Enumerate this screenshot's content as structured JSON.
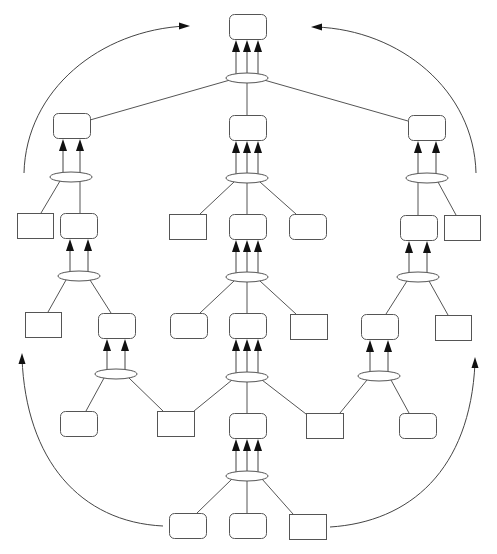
{
  "diagram": {
    "title": "",
    "caption": "",
    "colors": {
      "stroke": "#555555",
      "arrow": "#444444",
      "background": "#ffffff"
    },
    "nodes": [
      {
        "id": "root",
        "shape": "rounded",
        "x": 229,
        "y": 14,
        "w": 37,
        "h": 25
      },
      {
        "id": "L1",
        "shape": "rounded",
        "x": 53,
        "y": 113,
        "w": 37,
        "h": 25
      },
      {
        "id": "C1",
        "shape": "rounded",
        "x": 229,
        "y": 115,
        "w": 37,
        "h": 25
      },
      {
        "id": "R1",
        "shape": "rounded",
        "x": 408,
        "y": 115,
        "w": 37,
        "h": 25
      },
      {
        "id": "L2a",
        "shape": "rect",
        "x": 17,
        "y": 213,
        "w": 36,
        "h": 25
      },
      {
        "id": "L2b",
        "shape": "rounded",
        "x": 60,
        "y": 213,
        "w": 37,
        "h": 25
      },
      {
        "id": "C2a",
        "shape": "rect",
        "x": 169,
        "y": 214,
        "w": 37,
        "h": 25
      },
      {
        "id": "C2b",
        "shape": "rounded",
        "x": 229,
        "y": 214,
        "w": 37,
        "h": 25
      },
      {
        "id": "C2c",
        "shape": "rounded",
        "x": 289,
        "y": 214,
        "w": 37,
        "h": 25
      },
      {
        "id": "R2a",
        "shape": "rounded",
        "x": 400,
        "y": 215,
        "w": 37,
        "h": 25
      },
      {
        "id": "R2b",
        "shape": "rect",
        "x": 444,
        "y": 215,
        "w": 36,
        "h": 25
      },
      {
        "id": "L3a",
        "shape": "rect",
        "x": 25,
        "y": 312,
        "w": 36,
        "h": 25
      },
      {
        "id": "L3b",
        "shape": "rounded",
        "x": 98,
        "y": 313,
        "w": 37,
        "h": 25
      },
      {
        "id": "C3a",
        "shape": "rounded",
        "x": 170,
        "y": 313,
        "w": 37,
        "h": 25
      },
      {
        "id": "C3b",
        "shape": "rounded",
        "x": 229,
        "y": 313,
        "w": 37,
        "h": 25
      },
      {
        "id": "C3c",
        "shape": "rect",
        "x": 290,
        "y": 314,
        "w": 37,
        "h": 25
      },
      {
        "id": "R3a",
        "shape": "rounded",
        "x": 361,
        "y": 314,
        "w": 37,
        "h": 25
      },
      {
        "id": "R3b",
        "shape": "rect",
        "x": 435,
        "y": 315,
        "w": 36,
        "h": 25
      },
      {
        "id": "B4a",
        "shape": "rounded",
        "x": 60,
        "y": 411,
        "w": 37,
        "h": 25
      },
      {
        "id": "B4b",
        "shape": "rect",
        "x": 157,
        "y": 411,
        "w": 37,
        "h": 25
      },
      {
        "id": "B4c",
        "shape": "rounded",
        "x": 229,
        "y": 413,
        "w": 37,
        "h": 25
      },
      {
        "id": "B4d",
        "shape": "rect",
        "x": 306,
        "y": 413,
        "w": 37,
        "h": 25
      },
      {
        "id": "B4e",
        "shape": "rounded",
        "x": 399,
        "y": 413,
        "w": 37,
        "h": 25
      },
      {
        "id": "B5a",
        "shape": "rounded",
        "x": 169,
        "y": 513,
        "w": 37,
        "h": 25
      },
      {
        "id": "B5b",
        "shape": "rounded",
        "x": 229,
        "y": 513,
        "w": 37,
        "h": 25
      },
      {
        "id": "B5c",
        "shape": "rect",
        "x": 289,
        "y": 514,
        "w": 37,
        "h": 25
      }
    ],
    "hubs": [
      {
        "id": "h_root",
        "cx": 247,
        "cy": 78,
        "rx": 21,
        "ry": 5,
        "target": "root",
        "arrows": [
          236,
          247,
          258
        ]
      },
      {
        "id": "h_L1",
        "cx": 71,
        "cy": 177,
        "rx": 21,
        "ry": 5,
        "target": "L1",
        "arrows": [
          63,
          80
        ]
      },
      {
        "id": "h_C1",
        "cx": 247,
        "cy": 178,
        "rx": 21,
        "ry": 5,
        "target": "C1",
        "arrows": [
          236,
          247,
          258
        ]
      },
      {
        "id": "h_R1",
        "cx": 427,
        "cy": 178,
        "rx": 21,
        "ry": 5,
        "target": "R1",
        "arrows": [
          418,
          436
        ]
      },
      {
        "id": "h_L2",
        "cx": 79,
        "cy": 276,
        "rx": 21,
        "ry": 5,
        "target": "L2b",
        "arrows": [
          70,
          88
        ]
      },
      {
        "id": "h_C2",
        "cx": 247,
        "cy": 277,
        "rx": 21,
        "ry": 5,
        "target": "C2b",
        "arrows": [
          236,
          247,
          258
        ]
      },
      {
        "id": "h_R2",
        "cx": 418,
        "cy": 277,
        "rx": 21,
        "ry": 5,
        "target": "R2a",
        "arrows": [
          409,
          427
        ]
      },
      {
        "id": "h_L3",
        "cx": 116,
        "cy": 374,
        "rx": 21,
        "ry": 5,
        "target": "L3b",
        "arrows": [
          107,
          125
        ]
      },
      {
        "id": "h_C3",
        "cx": 247,
        "cy": 377,
        "rx": 21,
        "ry": 5,
        "target": "C3b",
        "arrows": [
          236,
          247,
          258
        ]
      },
      {
        "id": "h_R3",
        "cx": 379,
        "cy": 376,
        "rx": 21,
        "ry": 5,
        "target": "R3a",
        "arrows": [
          370,
          388
        ]
      },
      {
        "id": "h_B4",
        "cx": 247,
        "cy": 476,
        "rx": 21,
        "ry": 5,
        "target": "B4c",
        "arrows": [
          236,
          247,
          258
        ]
      }
    ],
    "edges": [
      {
        "from": "h_root",
        "x1": 230,
        "y1": 80,
        "x2": 90,
        "y2": 120
      },
      {
        "from": "h_root",
        "x1": 247,
        "y1": 83,
        "x2": 247,
        "y2": 115
      },
      {
        "from": "h_root",
        "x1": 264,
        "y1": 80,
        "x2": 408,
        "y2": 121
      },
      {
        "from": "h_L1",
        "x1": 60,
        "y1": 181,
        "x2": 41,
        "y2": 213
      },
      {
        "from": "h_L1",
        "x1": 80,
        "y1": 182,
        "x2": 80,
        "y2": 213
      },
      {
        "from": "h_C1",
        "x1": 234,
        "y1": 182,
        "x2": 200,
        "y2": 214
      },
      {
        "from": "h_C1",
        "x1": 247,
        "y1": 183,
        "x2": 247,
        "y2": 214
      },
      {
        "from": "h_C1",
        "x1": 260,
        "y1": 182,
        "x2": 296,
        "y2": 214
      },
      {
        "from": "h_R1",
        "x1": 418,
        "y1": 183,
        "x2": 418,
        "y2": 215
      },
      {
        "from": "h_R1",
        "x1": 438,
        "y1": 182,
        "x2": 456,
        "y2": 215
      },
      {
        "from": "h_L2",
        "x1": 66,
        "y1": 280,
        "x2": 48,
        "y2": 312
      },
      {
        "from": "h_L2",
        "x1": 90,
        "y1": 280,
        "x2": 111,
        "y2": 313
      },
      {
        "from": "h_C2",
        "x1": 234,
        "y1": 281,
        "x2": 200,
        "y2": 313
      },
      {
        "from": "h_C2",
        "x1": 247,
        "y1": 282,
        "x2": 247,
        "y2": 313
      },
      {
        "from": "h_C2",
        "x1": 260,
        "y1": 281,
        "x2": 296,
        "y2": 314
      },
      {
        "from": "h_R2",
        "x1": 407,
        "y1": 281,
        "x2": 386,
        "y2": 314
      },
      {
        "from": "h_R2",
        "x1": 429,
        "y1": 281,
        "x2": 448,
        "y2": 315
      },
      {
        "from": "h_L3",
        "x1": 104,
        "y1": 378,
        "x2": 86,
        "y2": 411
      },
      {
        "from": "h_L3",
        "x1": 129,
        "y1": 378,
        "x2": 163,
        "y2": 411
      },
      {
        "from": "h_C3",
        "x1": 232,
        "y1": 380,
        "x2": 194,
        "y2": 411
      },
      {
        "from": "h_C3",
        "x1": 247,
        "y1": 382,
        "x2": 247,
        "y2": 413
      },
      {
        "from": "h_C3",
        "x1": 262,
        "y1": 380,
        "x2": 306,
        "y2": 414
      },
      {
        "from": "h_R3",
        "x1": 367,
        "y1": 380,
        "x2": 340,
        "y2": 413
      },
      {
        "from": "h_R3",
        "x1": 391,
        "y1": 380,
        "x2": 409,
        "y2": 413
      },
      {
        "from": "h_B4",
        "x1": 232,
        "y1": 479,
        "x2": 197,
        "y2": 513
      },
      {
        "from": "h_B4",
        "x1": 247,
        "y1": 481,
        "x2": 247,
        "y2": 513
      },
      {
        "from": "h_B4",
        "x1": 262,
        "y1": 479,
        "x2": 293,
        "y2": 514
      }
    ],
    "curves": [
      {
        "id": "curve-top-left",
        "d": "M 24 173 C 26 90, 100 30, 186 26",
        "arrow_at": [
          190,
          26
        ],
        "arrow_dir": "right"
      },
      {
        "id": "curve-top-right",
        "d": "M 476 173 C 474 90, 400 30, 316 27",
        "arrow_at": [
          311,
          27
        ],
        "arrow_dir": "left"
      },
      {
        "id": "curve-bottom-left",
        "d": "M 163 526 C 80 522, 26 460, 22 358",
        "arrow_at": [
          22,
          353
        ],
        "arrow_dir": "up"
      },
      {
        "id": "curve-bottom-right",
        "d": "M 330 527 C 410 522, 470 470, 475 363",
        "arrow_at": [
          475,
          357
        ],
        "arrow_dir": "up"
      }
    ]
  }
}
